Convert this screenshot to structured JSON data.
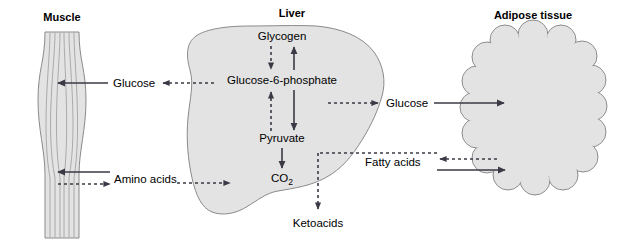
{
  "figure": {
    "background_color": "#ffffff",
    "tissue_fill_color": "#e3e3e3",
    "tissue_stroke_color": "#8a8a8a",
    "arrow_color": "#3a3a46"
  },
  "organs": [
    {
      "id": "muscle",
      "title": "Muscle",
      "shape": "fusiform-muscle-fiber"
    },
    {
      "id": "liver",
      "title": "Liver",
      "shape": "liver-lobe"
    },
    {
      "id": "adipose",
      "title": "Adipose tissue",
      "shape": "scalloped-fat-cell-cluster"
    }
  ],
  "liver_nodes": [
    {
      "id": "glycogen",
      "label": "Glycogen"
    },
    {
      "id": "g6p",
      "label": "Glucose-6-phosphate"
    },
    {
      "id": "pyruvate",
      "label": "Pyruvate"
    },
    {
      "id": "co2",
      "label": "CO",
      "subscript": "2"
    },
    {
      "id": "ketoacids",
      "label": "Ketoacids"
    }
  ],
  "liver_reactions": [
    {
      "from": "Glycogen",
      "to": "Glucose-6-phosphate",
      "style": "dashed",
      "direction": "down"
    },
    {
      "from": "Glucose-6-phosphate",
      "to": "Glycogen",
      "style": "solid",
      "direction": "up"
    },
    {
      "from": "Pyruvate",
      "to": "Glucose-6-phosphate",
      "style": "dashed",
      "direction": "up"
    },
    {
      "from": "Glucose-6-phosphate",
      "to": "Pyruvate",
      "style": "solid",
      "direction": "down"
    },
    {
      "from": "Pyruvate",
      "to": "CO2",
      "style": "solid",
      "direction": "down"
    },
    {
      "from": "Fatty acids",
      "to": "Ketoacids",
      "style": "dashed",
      "direction": "down"
    }
  ],
  "transport_labels": [
    {
      "id": "glucose-muscle",
      "label": "Glucose"
    },
    {
      "id": "amino-acids",
      "label": "Amino acids"
    },
    {
      "id": "glucose-adipose",
      "label": "Glucose"
    },
    {
      "id": "fatty-acids",
      "label": "Fatty acids"
    }
  ],
  "transport_flows": [
    {
      "id": "glucose-into-muscle",
      "label": "Glucose",
      "style": "solid",
      "direction": "left",
      "target": "muscle"
    },
    {
      "id": "glucose-from-liver",
      "label": "Glucose",
      "style": "dashed",
      "direction": "left",
      "source": "liver"
    },
    {
      "id": "amino-acids-into-muscle",
      "label": "Amino acids",
      "style": "solid",
      "direction": "left",
      "target": "muscle"
    },
    {
      "id": "amino-acids-from-muscle",
      "label": "Amino acids",
      "style": "dashed",
      "direction": "right",
      "source": "muscle"
    },
    {
      "id": "amino-acids-into-liver",
      "label": "Amino acids",
      "style": "dashed",
      "direction": "right",
      "target": "liver"
    },
    {
      "id": "glucose-from-liver-right",
      "label": "Glucose",
      "style": "dashed",
      "direction": "right",
      "source": "liver"
    },
    {
      "id": "glucose-into-adipose",
      "label": "Glucose",
      "style": "solid",
      "direction": "right",
      "target": "adipose"
    },
    {
      "id": "fatty-acids-from-adipose",
      "label": "Fatty acids",
      "style": "dashed",
      "direction": "left",
      "source": "adipose"
    },
    {
      "id": "fatty-acids-into-adipose",
      "label": "Fatty acids",
      "style": "solid",
      "direction": "right",
      "target": "adipose"
    },
    {
      "id": "fatty-acids-to-liver",
      "label": "Fatty acids",
      "style": "dashed",
      "direction": "left",
      "target": "liver"
    }
  ]
}
